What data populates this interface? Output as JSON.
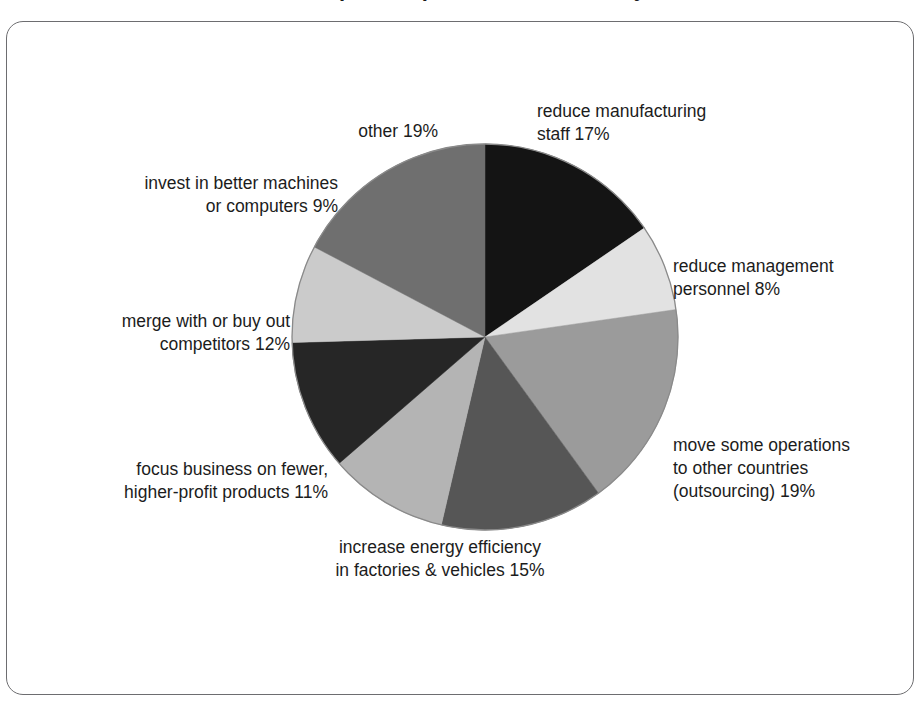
{
  "figure": {
    "title": "some companies' plans for the next 5 years",
    "frame_color": "#6d6d70",
    "background": "#ffffff"
  },
  "chart_data": {
    "type": "pie",
    "title": "some companies' plans for the next 5 years",
    "xlabel": "",
    "ylabel": "",
    "units": "percent",
    "total": 110,
    "start_angle_deg": 0,
    "direction": "clockwise",
    "legend_position": "callout-labels",
    "grid": false,
    "categories": [
      "reduce manufacturing staff",
      "reduce management personnel",
      "move some operations to other countries (outsourcing)",
      "increase energy efficiency in factories & vehicles",
      "focus business on fewer, higher-profit products",
      "merge with or buy out competitors",
      "invest in better machines or computers",
      "other"
    ],
    "values": [
      17,
      8,
      19,
      15,
      11,
      12,
      9,
      19
    ],
    "colors": [
      "#141414",
      "#e2e2e2",
      "#9b9b9b",
      "#565656",
      "#b4b4b4",
      "#262626",
      "#cbcbcb",
      "#6f6f6f"
    ],
    "slices": [
      {
        "label": "reduce manufacturing staff",
        "value": 17,
        "display": "17%",
        "color": "#141414"
      },
      {
        "label": "reduce management personnel",
        "value": 8,
        "display": "8%",
        "color": "#e2e2e2"
      },
      {
        "label": "move some operations to other countries (outsourcing)",
        "value": 19,
        "display": "19%",
        "color": "#9b9b9b"
      },
      {
        "label": "increase energy efficiency in factories & vehicles",
        "value": 15,
        "display": "15%",
        "color": "#565656"
      },
      {
        "label": "focus business on fewer, higher-profit products",
        "value": 11,
        "display": "11%",
        "color": "#b4b4b4"
      },
      {
        "label": "merge with or buy out competitors",
        "value": 12,
        "display": "12%",
        "color": "#262626"
      },
      {
        "label": "invest in better machines or computers",
        "value": 9,
        "display": "9%",
        "color": "#cbcbcb"
      },
      {
        "label": "other",
        "value": 19,
        "display": "19%",
        "color": "#6f6f6f"
      }
    ]
  },
  "labels": {
    "reduce_manufacturing_staff": "reduce manufacturing\nstaff 17%",
    "reduce_management_personnel": "reduce management\npersonnel 8%",
    "outsourcing": "move some operations\nto other countries\n(outsourcing) 19%",
    "energy_efficiency": "increase energy efficiency\nin factories & vehicles 15%",
    "focus_business": "focus business on fewer,\nhigher-profit products 11%",
    "merge_competitors": "merge with or buy out\ncompetitors 12%",
    "invest_machines": "invest in better machines\nor computers 9%",
    "other": "other 19%"
  }
}
